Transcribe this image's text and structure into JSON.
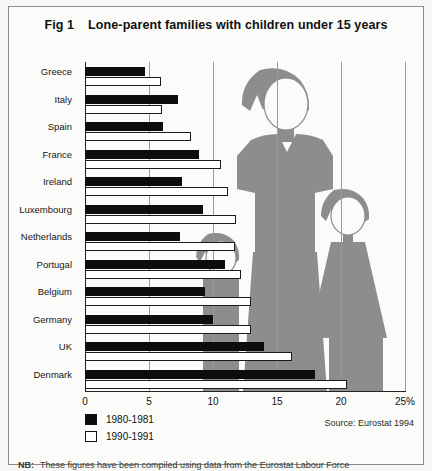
{
  "figure": {
    "number": "Fig 1",
    "title": "Lone-parent families with children under 15 years",
    "source": "Source: Eurostat 1994",
    "footnote_prefix": "NB:",
    "footnote": "These figures have been compiled using data from the Eurostat Labour Force"
  },
  "legend": {
    "position": "bottom-left",
    "items": [
      {
        "label": "1980-1981",
        "swatch": "black"
      },
      {
        "label": "1990-1991",
        "swatch": "white"
      }
    ]
  },
  "artwork": {
    "name": "lone-parent-family-silhouette",
    "color": "#8d8d8d",
    "description": "Grey silhouette of one adult parent standing between two children"
  },
  "colors": {
    "series_1980": "#0d0d0d",
    "series_1990": "#ffffff",
    "artwork_grey": "#8d8d8d",
    "gridline": "#9a9a9a",
    "axis": "#222222",
    "frame": "#8a8a8a",
    "background": "#fbfbf9"
  },
  "chart_data": {
    "type": "bar",
    "orientation": "horizontal",
    "title": "Lone-parent families with children under 15 years",
    "xlabel": "",
    "ylabel": "",
    "xlim": [
      0,
      25
    ],
    "xticks": [
      0,
      5,
      10,
      15,
      20,
      25
    ],
    "xtick_labels": [
      "0",
      "5",
      "10",
      "15",
      "20",
      "25%"
    ],
    "grid": true,
    "legend_position": "bottom-left",
    "categories": [
      "Greece",
      "Italy",
      "Spain",
      "France",
      "Ireland",
      "Luxembourg",
      "Netherlands",
      "Portugal",
      "Belgium",
      "Germany",
      "UK",
      "Denmark"
    ],
    "series": [
      {
        "name": "1980-1981",
        "color": "#0d0d0d",
        "values": [
          4.7,
          7.3,
          6.1,
          8.9,
          7.6,
          9.2,
          7.4,
          10.9,
          9.4,
          10.0,
          14.0,
          18.0
        ]
      },
      {
        "name": "1990-1991",
        "color": "#ffffff",
        "values": [
          5.9,
          6.0,
          8.3,
          10.6,
          11.2,
          11.8,
          11.7,
          12.2,
          13.0,
          13.0,
          16.2,
          20.5
        ]
      }
    ],
    "units": "percent of families"
  }
}
